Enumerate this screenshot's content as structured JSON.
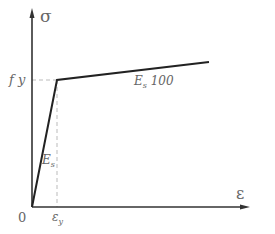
{
  "diagram": {
    "type": "stress-strain bilinear curve",
    "axes": {
      "y_label": "σ",
      "x_label": "ε",
      "origin_label": "0"
    },
    "labels": {
      "yield_stress": "f y",
      "yield_strain": "εy",
      "elastic_modulus": "Es",
      "hardening_slope": "Es/100"
    },
    "points": {
      "origin": [
        0,
        0
      ],
      "yield": [
        "εy",
        "fy"
      ]
    },
    "colors": {
      "curve": "#222222",
      "axis": "#333333",
      "dashed": "#bbbbbb",
      "text": "#666666"
    }
  }
}
